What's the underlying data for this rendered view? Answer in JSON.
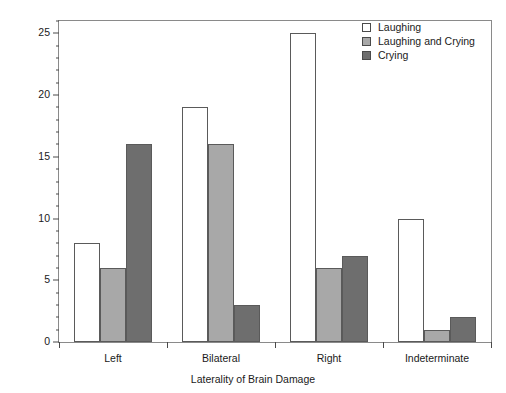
{
  "chart_data": {
    "type": "bar",
    "title": "",
    "xlabel": "Laterality of Brain Damage",
    "ylabel": "Number of Patients",
    "categories": [
      "Left",
      "Bilateral",
      "Right",
      "Indeterminate"
    ],
    "series": [
      {
        "name": "Laughing",
        "color": "#ffffff",
        "values": [
          8,
          19,
          25,
          10
        ]
      },
      {
        "name": "Laughing and Crying",
        "color": "#a8a8a8",
        "values": [
          6,
          16,
          6,
          1
        ]
      },
      {
        "name": "Crying",
        "color": "#6e6e6e",
        "values": [
          16,
          3,
          7,
          2
        ]
      }
    ],
    "ylim": [
      0,
      26
    ],
    "ytick_major": [
      0,
      5,
      10,
      15,
      20,
      25
    ],
    "ytick_major_labels": [
      "0",
      "5",
      "10",
      "15",
      "20",
      "25"
    ],
    "ytick_minor_step": 1,
    "grid": false,
    "legend_position": "top-right",
    "legend_entries": [
      "Laughing",
      "Laughing and Crying",
      "Crying"
    ]
  },
  "axes": {
    "y_title": "Number of Patients",
    "x_title": "Laterality of Brain Damage"
  }
}
